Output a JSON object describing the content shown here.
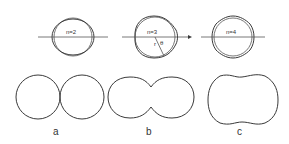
{
  "diagram": {
    "top_row": [
      {
        "mode_label": "n=2",
        "cx": 73,
        "cy": 37
      },
      {
        "mode_label": "n=3",
        "cx": 155,
        "cy": 37,
        "radius_label": "r",
        "angle_label": "θ"
      },
      {
        "mode_label": "n=4",
        "cx": 233,
        "cy": 37
      }
    ],
    "bottom_row": [
      {
        "caption": "a",
        "description": "two touching spheres"
      },
      {
        "caption": "b",
        "description": "necked peanut shape"
      },
      {
        "caption": "c",
        "description": "elongated rounded shape with waist"
      }
    ],
    "colors": {
      "line": "#3a3a3a",
      "background": "#ffffff"
    }
  }
}
